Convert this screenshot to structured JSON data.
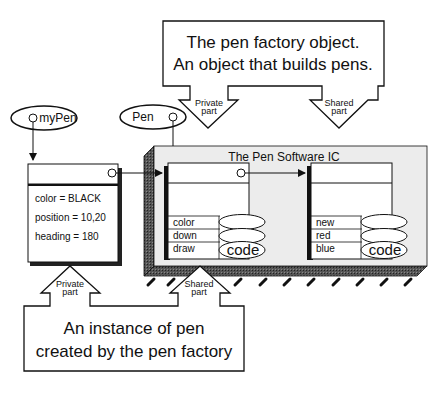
{
  "factory_callout": {
    "line1": "The pen factory object.",
    "line2": "An object that builds pens.",
    "private_arrow": {
      "line1": "Private",
      "line2": "part"
    },
    "shared_arrow": {
      "line1": "Shared",
      "line2": "part"
    }
  },
  "instance_callout": {
    "line1": "An instance of pen",
    "line2": "created by the pen factory",
    "private_arrow": {
      "line1": "Private",
      "line2": "part"
    },
    "shared_arrow": {
      "line1": "Shared",
      "line2": "part"
    }
  },
  "references": [
    {
      "label": "myPen"
    },
    {
      "label": "Pen"
    }
  ],
  "instance_object": {
    "fields": [
      "color = BLACK",
      "position = 10,20",
      "heading = 180"
    ]
  },
  "ic_chip": {
    "title": "The Pen Software IC",
    "pen_class": {
      "methods": [
        "color",
        "down",
        "draw"
      ],
      "code_label": "code"
    },
    "metaclass": {
      "methods": [
        "new",
        "red",
        "blue"
      ],
      "code_label": "code"
    }
  },
  "colors": {
    "chip_face": "#ececec",
    "chip_shadow": "#3a3a3a",
    "stroke": "#111111"
  }
}
